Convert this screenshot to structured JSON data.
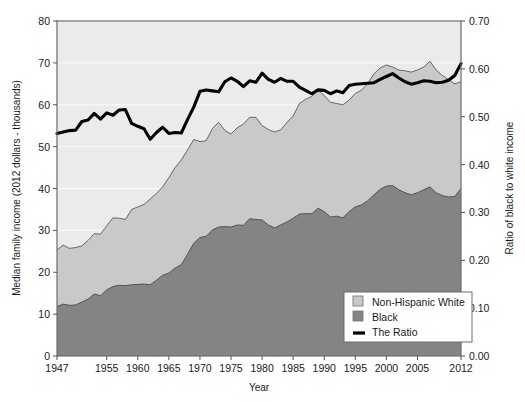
{
  "chart_data": {
    "type": "area",
    "title": "",
    "xlabel": "Year",
    "ylabel": "Median family income (2012 dollars - thousands)",
    "y2label": "Ratio of black to white income",
    "xlim": [
      1947,
      2012
    ],
    "ylim": [
      0,
      80
    ],
    "y2lim": [
      0.0,
      0.7
    ],
    "grid": true,
    "legend_position": "bottom-right",
    "xticks": [
      "1947",
      "1955",
      "1960",
      "1965",
      "1970",
      "1975",
      "1980",
      "1985",
      "1990",
      "1995",
      "2000",
      "2005",
      "2012"
    ],
    "xtick_values": [
      1947,
      1955,
      1960,
      1965,
      1970,
      1975,
      1980,
      1985,
      1990,
      1995,
      2000,
      2005,
      2012
    ],
    "yticks": [
      "0",
      "10",
      "20",
      "30",
      "40",
      "50",
      "60",
      "70",
      "80"
    ],
    "ytick_values": [
      0,
      10,
      20,
      30,
      40,
      50,
      60,
      70,
      80
    ],
    "y2ticks": [
      "0.00",
      "0.10",
      "0.20",
      "0.30",
      "0.40",
      "0.50",
      "0.60",
      "0.70"
    ],
    "y2tick_values": [
      0.0,
      0.1,
      0.2,
      0.3,
      0.4,
      0.5,
      0.6,
      0.7
    ],
    "x": [
      1947,
      1948,
      1949,
      1950,
      1951,
      1952,
      1953,
      1954,
      1955,
      1956,
      1957,
      1958,
      1959,
      1960,
      1961,
      1962,
      1963,
      1964,
      1965,
      1966,
      1967,
      1968,
      1969,
      1970,
      1971,
      1972,
      1973,
      1974,
      1975,
      1976,
      1977,
      1978,
      1979,
      1980,
      1981,
      1982,
      1983,
      1984,
      1985,
      1986,
      1987,
      1988,
      1989,
      1990,
      1991,
      1992,
      1993,
      1994,
      1995,
      1996,
      1997,
      1998,
      1999,
      2000,
      2001,
      2002,
      2003,
      2004,
      2005,
      2006,
      2007,
      2008,
      2009,
      2010,
      2011,
      2012
    ],
    "series": [
      {
        "name": "Non-Hispanic White",
        "axis": "left",
        "color": "#c9c9c9",
        "values": [
          25.3,
          26.5,
          25.7,
          25.9,
          26.3,
          27.6,
          29.2,
          29.1,
          31.1,
          33.0,
          32.9,
          32.6,
          35.0,
          35.6,
          36.2,
          37.5,
          38.8,
          40.4,
          42.6,
          45.0,
          46.8,
          49.2,
          51.7,
          51.2,
          51.4,
          54.3,
          55.8,
          53.9,
          53.0,
          54.5,
          55.4,
          57.0,
          57.0,
          55.0,
          54.1,
          53.5,
          54.0,
          55.8,
          57.3,
          60.3,
          61.3,
          62.0,
          63.5,
          62.2,
          60.6,
          60.3,
          60.0,
          61.1,
          62.7,
          63.5,
          65.1,
          67.4,
          68.8,
          69.5,
          69.0,
          68.3,
          68.1,
          67.8,
          68.3,
          69.0,
          70.4,
          68.3,
          67.0,
          66.0,
          65.0,
          65.5
        ]
      },
      {
        "name": "Black",
        "axis": "left",
        "color": "#848484",
        "values": [
          11.8,
          12.4,
          12.1,
          12.2,
          12.9,
          13.6,
          14.8,
          14.4,
          15.8,
          16.6,
          16.9,
          16.8,
          17.0,
          17.1,
          17.2,
          17.0,
          18.1,
          19.3,
          19.8,
          21.0,
          21.8,
          24.3,
          26.9,
          28.3,
          28.6,
          30.1,
          30.8,
          30.9,
          30.8,
          31.3,
          31.2,
          32.8,
          32.6,
          32.5,
          31.3,
          30.6,
          31.3,
          32.0,
          32.9,
          33.9,
          34.0,
          34.0,
          35.3,
          34.5,
          33.2,
          33.4,
          33.0,
          34.5,
          35.6,
          36.1,
          37.1,
          38.5,
          39.8,
          40.6,
          40.7,
          39.7,
          39.0,
          38.5,
          39.0,
          39.7,
          40.4,
          39.0,
          38.3,
          38.0,
          38.1,
          40.0
        ]
      },
      {
        "name": "The Ratio",
        "axis": "right",
        "color": "#000000",
        "values": [
          0.465,
          0.468,
          0.471,
          0.472,
          0.49,
          0.493,
          0.507,
          0.495,
          0.508,
          0.503,
          0.514,
          0.515,
          0.486,
          0.48,
          0.475,
          0.453,
          0.467,
          0.478,
          0.465,
          0.467,
          0.466,
          0.494,
          0.52,
          0.553,
          0.556,
          0.554,
          0.552,
          0.573,
          0.581,
          0.574,
          0.563,
          0.575,
          0.572,
          0.591,
          0.578,
          0.572,
          0.58,
          0.574,
          0.574,
          0.562,
          0.555,
          0.548,
          0.556,
          0.555,
          0.548,
          0.554,
          0.55,
          0.565,
          0.568,
          0.569,
          0.57,
          0.571,
          0.578,
          0.584,
          0.59,
          0.581,
          0.573,
          0.568,
          0.571,
          0.575,
          0.574,
          0.571,
          0.572,
          0.576,
          0.586,
          0.611
        ]
      }
    ]
  },
  "legend": {
    "items": [
      {
        "label": "Non-Hispanic White",
        "swatch": "area",
        "color": "#c9c9c9"
      },
      {
        "label": "Black",
        "swatch": "area",
        "color": "#848484"
      },
      {
        "label": "The Ratio",
        "swatch": "line",
        "color": "#000000"
      }
    ]
  },
  "colors": {
    "plot_background": "#ebebeb",
    "white_area": "#c9c9c9",
    "black_area": "#848484",
    "ratio_line": "#000000",
    "gridline": "#f7f7f7",
    "axis": "#555555",
    "legend_background": "#ffffff",
    "text": "#1a1a1a"
  }
}
